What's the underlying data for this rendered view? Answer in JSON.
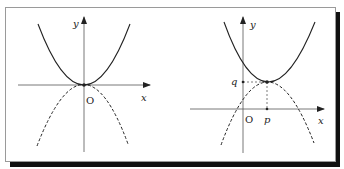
{
  "figure": {
    "frame": {
      "border_color": "#999999",
      "shadow_color": "#111111"
    },
    "left_graph": {
      "axis_labels": {
        "x": "x",
        "y": "y"
      },
      "origin_label": "O",
      "curves": [
        {
          "name": "upward-parabola",
          "style": "solid",
          "equation": "y = ax^2"
        },
        {
          "name": "downward-parabola",
          "style": "dashed",
          "equation": "y = -ax^2"
        }
      ]
    },
    "right_graph": {
      "axis_labels": {
        "x": "x",
        "y": "y"
      },
      "origin_label": "O",
      "vertex_labels": {
        "p": "p",
        "q": "q"
      },
      "curves": [
        {
          "name": "upward-parabola-shifted",
          "style": "solid",
          "equation": "y = a(x-p)^2 + q"
        },
        {
          "name": "downward-parabola-through-vertex",
          "style": "dashed"
        }
      ]
    }
  }
}
